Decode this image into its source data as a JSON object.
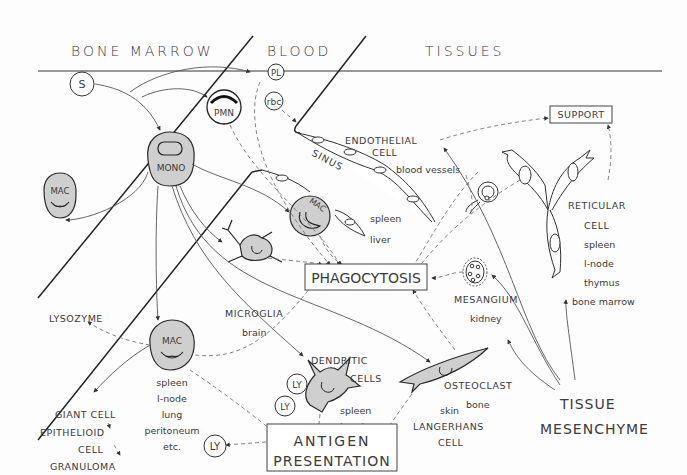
{
  "regions": {
    "bone_marrow": "BONE MARROW",
    "blood": "BLOOD",
    "tissues": "TISSUES"
  },
  "cells": {
    "stem": "S",
    "platelet": "PL",
    "rbc": "rbc",
    "pmn": "PMN",
    "mono": "MONO",
    "mac_marrow": "MAC",
    "mac_tissue": "MAC",
    "mac_sinus": "MAC",
    "ly_dendritic_1": "LY",
    "ly_dendritic_2": "LY",
    "ly_antigen": "LY"
  },
  "labels": {
    "sinus": "SINUS",
    "endothelial_1": "ENDOTHELIAL",
    "endothelial_2": "CELL",
    "blood_vessels": "blood vessels",
    "sinus_locs_1": "spleen",
    "sinus_locs_2": "liver",
    "support": "SUPPORT",
    "reticular_1": "RETICULAR",
    "reticular_2": "CELL",
    "reticular_locs": [
      "spleen",
      "l-node",
      "thymus",
      "bone marrow"
    ],
    "mesangium": "MESANGIUM",
    "kidney": "kidney",
    "osteoclast": "OSTEOCLAST",
    "bone": "bone",
    "microglia": "MICROGLIA",
    "brain": "brain",
    "lysozyme": "LYSOZYME",
    "mac_locs": [
      "spleen",
      "l-node",
      "lung",
      "peritoneum",
      "etc."
    ],
    "giant_cell": "GIANT CELL",
    "epithelioid_1": "EPITHELIOID",
    "epithelioid_2": "CELL",
    "granuloma": "GRANULOMA",
    "chronic_inflammation": "CHRONIC  INFLAMMATION",
    "dendritic_1": "DENDRITIC",
    "dendritic_2": "CELLS",
    "dendritic_locs_1": "spleen",
    "dendritic_locs_2": "l-node",
    "langerhans_loc": "skin",
    "langerhans_1": "LANGERHANS",
    "langerhans_2": "CELL",
    "tissue_1": "TISSUE",
    "tissue_2": "MESENCHYME"
  },
  "boxes": {
    "phagocytosis": "PHAGOCYTOSIS",
    "antigen_1": "ANTIGEN",
    "antigen_2": "PRESENTATION"
  }
}
